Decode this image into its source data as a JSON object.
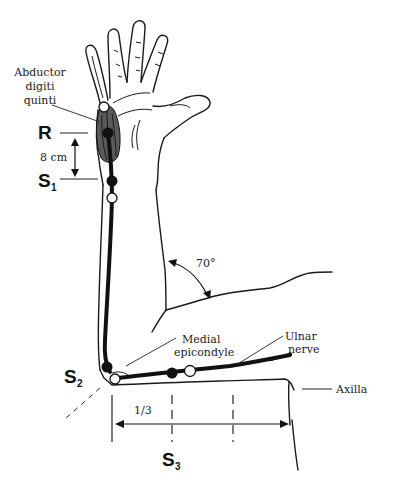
{
  "figure": {
    "labels": {
      "muscle": [
        "Abductor",
        "digiti",
        "quinti"
      ],
      "recording": "R",
      "distance": "8 cm",
      "stim1": "S",
      "stim1_sub": "1",
      "stim2": "S",
      "stim2_sub": "2",
      "stim3": "S",
      "stim3_sub": "3",
      "angle": "70°",
      "epicondyle": [
        "Medial",
        "epicondyle"
      ],
      "nerve": [
        "Ulnar",
        "nerve"
      ],
      "axilla": "Axilla",
      "fraction": "1/3"
    },
    "colors": {
      "ink": "#111111",
      "muscle_fill": "#4a4a4a",
      "background": "#ffffff"
    },
    "electrodes": [
      {
        "type": "open",
        "x": 104,
        "y": 107,
        "site": "distal-hand"
      },
      {
        "type": "filled",
        "x": 108,
        "y": 133,
        "site": "R"
      },
      {
        "type": "filled",
        "x": 112,
        "y": 181,
        "site": "S1"
      },
      {
        "type": "open",
        "x": 112,
        "y": 198,
        "site": "S1"
      },
      {
        "type": "filled",
        "x": 107,
        "y": 367,
        "site": "S2"
      },
      {
        "type": "open",
        "x": 115,
        "y": 379,
        "site": "S2"
      },
      {
        "type": "filled",
        "x": 172,
        "y": 373,
        "site": "S3"
      },
      {
        "type": "open",
        "x": 190,
        "y": 371,
        "site": "S3"
      }
    ],
    "caption_fragment": ""
  }
}
